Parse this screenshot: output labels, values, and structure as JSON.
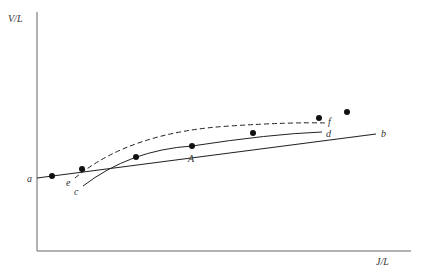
{
  "axes": {
    "y_label": "V/L",
    "x_label": "J/L",
    "color": "#555555"
  },
  "lines": {
    "straight": {
      "start_label": "a",
      "end_label": "b",
      "style": "solid"
    },
    "dashed_curve": {
      "start_label": "e",
      "end_label": "f",
      "style": "dashed"
    },
    "solid_curve": {
      "start_label": "c",
      "end_label": "d",
      "style": "solid"
    }
  },
  "point_label": "A",
  "points_on_line_count": 7,
  "colors": {
    "ink": "#222222",
    "background": "#ffffff"
  }
}
